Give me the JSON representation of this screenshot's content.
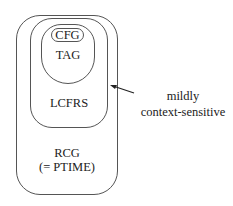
{
  "diagram": {
    "sets": [
      {
        "id": "rcg",
        "label": "RCG",
        "sublabel": "(= PTIME)"
      },
      {
        "id": "lcfrs",
        "label": "LCFRS"
      },
      {
        "id": "tag",
        "label": "TAG"
      },
      {
        "id": "cfg",
        "label": "CFG"
      }
    ],
    "annotation": {
      "line1": "mildly",
      "line2": "context-sensitive",
      "points_to": "lcfrs"
    }
  }
}
